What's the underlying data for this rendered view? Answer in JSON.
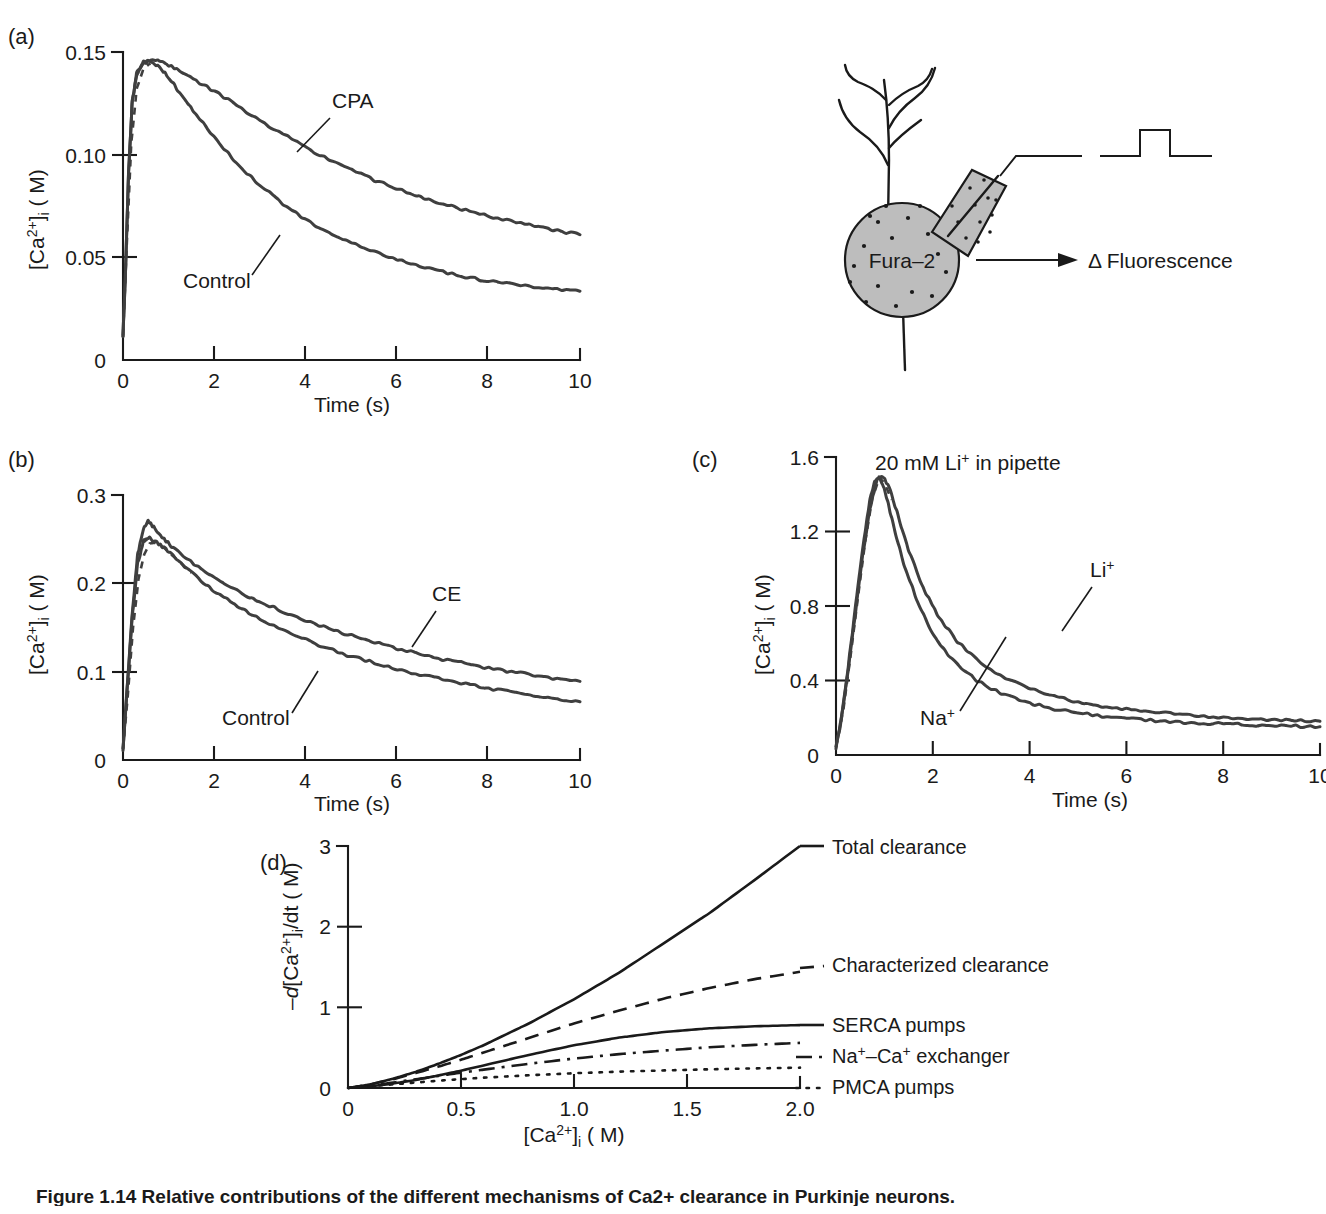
{
  "figure": {
    "caption": "Figure 1.14 Relative contributions of the different mechanisms of Ca2+ clearance in Purkinje neurons."
  },
  "panels": {
    "a": {
      "letter": "(a)",
      "xlabel": "Time (s)",
      "ylabel_prefix": "[Ca",
      "ylabel_sup": "2+",
      "ylabel_mid": "]",
      "ylabel_sub": "i",
      "ylabel_suffix": " ( M)",
      "xticks": [
        "0",
        "2",
        "4",
        "6",
        "8",
        "10"
      ],
      "yticks": [
        "0",
        "0.05",
        "0.10",
        "0.15"
      ],
      "labels": {
        "upper": "CPA",
        "lower": "Control"
      }
    },
    "b": {
      "letter": "(b)",
      "xlabel": "Time (s)",
      "ylabel_prefix": "[Ca",
      "ylabel_sup": "2+",
      "ylabel_mid": "]",
      "ylabel_sub": "i",
      "ylabel_suffix": " ( M)",
      "xticks": [
        "0",
        "2",
        "4",
        "6",
        "8",
        "10"
      ],
      "yticks": [
        "0",
        "0.1",
        "0.2",
        "0.3"
      ],
      "labels": {
        "upper": "CE",
        "lower": "Control"
      }
    },
    "c": {
      "letter": "(c)",
      "title_prefix": "20 mM Li",
      "title_sup": "+",
      "title_suffix": " in pipette",
      "xlabel": "Time (s)",
      "ylabel_prefix": "[Ca",
      "ylabel_sup": "2+",
      "ylabel_mid": "]",
      "ylabel_sub": "i",
      "ylabel_suffix": " ( M)",
      "xticks": [
        "0",
        "2",
        "4",
        "6",
        "8",
        "10"
      ],
      "yticks": [
        "0",
        "0.4",
        "0.8",
        "1.2",
        "1.6"
      ],
      "labels": {
        "upper_prefix": "Li",
        "upper_sup": "+",
        "lower_prefix": "Na",
        "lower_sup": "+"
      }
    },
    "d": {
      "letter": "(d)",
      "xlabel_prefix": "[Ca",
      "xlabel_sup": "2+",
      "xlabel_mid": "]",
      "xlabel_sub": "i",
      "xlabel_suffix": " ( M)",
      "ylabel_neg": "–",
      "ylabel_d": "d",
      "ylabel_prefix": "[Ca",
      "ylabel_sup": "2+",
      "ylabel_mid": "]",
      "ylabel_sub": "i",
      "ylabel_suffix": "/dt ( M)",
      "xticks": [
        "0",
        "0.5",
        "1.0",
        "1.5",
        "2.0"
      ],
      "yticks": [
        "0",
        "1",
        "2",
        "3"
      ],
      "legend": [
        {
          "name": "total-clearance",
          "label": "Total clearance",
          "style": "solid"
        },
        {
          "name": "characterized-clearance",
          "label": "Characterized clearance",
          "style": "dashed"
        },
        {
          "name": "serca-pumps",
          "label": "SERCA pumps",
          "style": "solid"
        },
        {
          "name": "na-ca-exchanger",
          "label_parts": [
            "Na",
            "+",
            "–Ca",
            "+",
            " exchanger"
          ],
          "label": "Na+–Ca+ exchanger",
          "style": "dashdot"
        },
        {
          "name": "pmca-pumps",
          "label": "PMCA pumps",
          "style": "dotted"
        }
      ]
    },
    "diagram": {
      "cell_label": "Fura–2",
      "output_label": "Δ Fluorescence"
    }
  },
  "chart_data": [
    {
      "id": "a",
      "type": "line",
      "title": "",
      "xlabel": "Time (s)",
      "ylabel": "[Ca2+]i ( M)",
      "xlim": [
        0,
        10
      ],
      "ylim": [
        0,
        0.15
      ],
      "grid": false,
      "legend_position": "inline-annotations",
      "series": [
        {
          "name": "CPA",
          "style": "solid-noisy",
          "x": [
            0,
            0.05,
            0.12,
            0.2,
            0.3,
            0.45,
            0.6,
            0.8,
            1.0,
            1.3,
            1.6,
            2.0,
            2.5,
            3.0,
            3.5,
            4.0,
            4.5,
            5.0,
            5.5,
            6.0,
            6.5,
            7.0,
            7.5,
            8.0,
            8.5,
            9.0,
            9.5,
            10.0
          ],
          "y": [
            0.012,
            0.04,
            0.09,
            0.125,
            0.139,
            0.1445,
            0.146,
            0.1455,
            0.1435,
            0.14,
            0.136,
            0.131,
            0.124,
            0.1165,
            0.11,
            0.1035,
            0.0975,
            0.0925,
            0.0875,
            0.0835,
            0.0795,
            0.076,
            0.073,
            0.07,
            0.0675,
            0.0655,
            0.063,
            0.061
          ]
        },
        {
          "name": "Control",
          "style": "solid-noisy",
          "x": [
            0,
            0.05,
            0.12,
            0.2,
            0.3,
            0.45,
            0.6,
            0.8,
            1.0,
            1.3,
            1.6,
            2.0,
            2.5,
            3.0,
            3.5,
            4.0,
            4.5,
            5.0,
            5.5,
            6.0,
            6.5,
            7.0,
            7.5,
            8.0,
            8.5,
            9.0,
            9.5,
            10.0
          ],
          "y": [
            0.012,
            0.04,
            0.09,
            0.125,
            0.14,
            0.1455,
            0.1455,
            0.1425,
            0.1375,
            0.1285,
            0.1195,
            0.1085,
            0.0955,
            0.085,
            0.076,
            0.0685,
            0.062,
            0.057,
            0.0525,
            0.049,
            0.0455,
            0.043,
            0.0405,
            0.0385,
            0.037,
            0.0355,
            0.0345,
            0.0335
          ]
        },
        {
          "name": "rising-dashed-overlay",
          "style": "dashed",
          "x": [
            0.0,
            0.08,
            0.18,
            0.3,
            0.45,
            0.6
          ],
          "y": [
            0.012,
            0.055,
            0.105,
            0.132,
            0.142,
            0.1445
          ]
        }
      ]
    },
    {
      "id": "b",
      "type": "line",
      "title": "",
      "xlabel": "Time (s)",
      "ylabel": "[Ca2+]i ( M)",
      "xlim": [
        0,
        10
      ],
      "ylim": [
        0,
        0.3
      ],
      "grid": false,
      "legend_position": "inline-annotations",
      "series": [
        {
          "name": "CE",
          "style": "solid-noisy",
          "x": [
            0,
            0.08,
            0.2,
            0.32,
            0.45,
            0.55,
            0.7,
            0.9,
            1.1,
            1.4,
            1.8,
            2.2,
            2.6,
            3.0,
            3.5,
            4.0,
            4.5,
            5.0,
            5.5,
            6.0,
            6.5,
            7.0,
            7.5,
            8.0,
            8.5,
            9.0,
            9.5,
            10.0
          ],
          "y": [
            0.012,
            0.075,
            0.165,
            0.232,
            0.262,
            0.27,
            0.262,
            0.25,
            0.24,
            0.228,
            0.213,
            0.2,
            0.189,
            0.179,
            0.168,
            0.158,
            0.149,
            0.141,
            0.133,
            0.126,
            0.12,
            0.114,
            0.109,
            0.104,
            0.1,
            0.096,
            0.092,
            0.089
          ]
        },
        {
          "name": "Control",
          "style": "solid-noisy",
          "x": [
            0,
            0.08,
            0.2,
            0.32,
            0.45,
            0.55,
            0.7,
            0.9,
            1.1,
            1.4,
            1.8,
            2.2,
            2.6,
            3.0,
            3.5,
            4.0,
            4.5,
            5.0,
            5.5,
            6.0,
            6.5,
            7.0,
            7.5,
            8.0,
            8.5,
            9.0,
            9.5,
            10.0
          ],
          "y": [
            0.012,
            0.072,
            0.16,
            0.222,
            0.248,
            0.252,
            0.248,
            0.24,
            0.231,
            0.217,
            0.199,
            0.184,
            0.171,
            0.16,
            0.147,
            0.136,
            0.126,
            0.117,
            0.11,
            0.103,
            0.097,
            0.091,
            0.086,
            0.081,
            0.077,
            0.073,
            0.069,
            0.066
          ]
        },
        {
          "name": "rising-dashed-overlay",
          "style": "dashed",
          "x": [
            0.0,
            0.1,
            0.22,
            0.34,
            0.46,
            0.58,
            0.7,
            0.9,
            1.2,
            1.5
          ],
          "y": [
            0.012,
            0.07,
            0.15,
            0.205,
            0.232,
            0.245,
            0.246,
            0.24,
            0.226,
            0.212
          ]
        }
      ]
    },
    {
      "id": "c",
      "type": "line",
      "title": "20 mM Li+ in pipette",
      "xlabel": "Time (s)",
      "ylabel": "[Ca2+]i ( M)",
      "xlim": [
        0,
        10
      ],
      "ylim": [
        0,
        1.6
      ],
      "grid": false,
      "legend_position": "inline-annotations",
      "series": [
        {
          "name": "Li+",
          "style": "solid-noisy",
          "x": [
            0,
            0.1,
            0.25,
            0.4,
            0.55,
            0.7,
            0.85,
            0.95,
            1.1,
            1.3,
            1.5,
            1.8,
            2.1,
            2.5,
            3.0,
            3.5,
            4.0,
            4.5,
            5.0,
            5.5,
            6.0,
            6.5,
            7.0,
            7.5,
            8.0,
            8.5,
            9.0,
            9.5,
            10.0
          ],
          "y": [
            0.04,
            0.17,
            0.45,
            0.76,
            1.07,
            1.32,
            1.48,
            1.5,
            1.44,
            1.27,
            1.1,
            0.9,
            0.75,
            0.61,
            0.49,
            0.41,
            0.355,
            0.315,
            0.285,
            0.263,
            0.245,
            0.231,
            0.22,
            0.211,
            0.203,
            0.196,
            0.19,
            0.185,
            0.181
          ]
        },
        {
          "name": "Na+",
          "style": "solid-noisy",
          "x": [
            0,
            0.1,
            0.25,
            0.4,
            0.55,
            0.7,
            0.8,
            0.9,
            1.0,
            1.2,
            1.4,
            1.7,
            2.0,
            2.4,
            2.9,
            3.4,
            3.9,
            4.4,
            5.0,
            5.5,
            6.0,
            6.5,
            7.0,
            7.5,
            8.0,
            8.5,
            9.0,
            9.5,
            10.0
          ],
          "y": [
            0.04,
            0.18,
            0.47,
            0.79,
            1.11,
            1.37,
            1.47,
            1.49,
            1.43,
            1.22,
            1.03,
            0.81,
            0.65,
            0.51,
            0.4,
            0.33,
            0.285,
            0.253,
            0.226,
            0.209,
            0.196,
            0.186,
            0.178,
            0.172,
            0.167,
            0.162,
            0.158,
            0.155,
            0.152
          ]
        },
        {
          "name": "rising-dashed-overlay",
          "style": "dashed",
          "x": [
            0.0,
            0.15,
            0.3,
            0.45,
            0.6,
            0.75,
            0.9,
            1.0,
            1.15
          ],
          "y": [
            0.04,
            0.24,
            0.53,
            0.84,
            1.14,
            1.38,
            1.49,
            1.46,
            1.37
          ]
        }
      ]
    },
    {
      "id": "d",
      "type": "line",
      "title": "",
      "xlabel": "[Ca2+]i ( M)",
      "ylabel": "-d[Ca2+]i/dt ( M)",
      "xlim": [
        0,
        2.0
      ],
      "ylim": [
        0,
        3.0
      ],
      "grid": false,
      "legend_position": "right-inline",
      "series": [
        {
          "name": "Total clearance",
          "style": "solid",
          "x": [
            0,
            0.1,
            0.2,
            0.3,
            0.4,
            0.5,
            0.6,
            0.8,
            1.0,
            1.2,
            1.4,
            1.6,
            1.8,
            2.0
          ],
          "y": [
            0,
            0.045,
            0.115,
            0.2,
            0.3,
            0.41,
            0.53,
            0.8,
            1.1,
            1.43,
            1.8,
            2.17,
            2.58,
            3.0
          ]
        },
        {
          "name": "Characterized clearance",
          "style": "dashed",
          "x": [
            0,
            0.1,
            0.2,
            0.3,
            0.4,
            0.5,
            0.6,
            0.8,
            1.0,
            1.2,
            1.4,
            1.6,
            1.8,
            2.0
          ],
          "y": [
            0,
            0.045,
            0.11,
            0.185,
            0.265,
            0.35,
            0.44,
            0.62,
            0.8,
            0.96,
            1.11,
            1.24,
            1.35,
            1.44
          ]
        },
        {
          "name": "SERCA pumps",
          "style": "solid",
          "x": [
            0,
            0.1,
            0.2,
            0.3,
            0.4,
            0.5,
            0.6,
            0.8,
            1.0,
            1.2,
            1.4,
            1.6,
            1.8,
            2.0
          ],
          "y": [
            0,
            0.022,
            0.055,
            0.1,
            0.155,
            0.215,
            0.28,
            0.41,
            0.53,
            0.625,
            0.695,
            0.74,
            0.765,
            0.78
          ]
        },
        {
          "name": "Na+-Ca+ exchanger",
          "style": "dashdot",
          "x": [
            0,
            0.1,
            0.2,
            0.3,
            0.4,
            0.5,
            0.6,
            0.8,
            1.0,
            1.2,
            1.4,
            1.6,
            1.8,
            2.0
          ],
          "y": [
            0,
            0.03,
            0.068,
            0.108,
            0.15,
            0.19,
            0.228,
            0.3,
            0.365,
            0.42,
            0.465,
            0.505,
            0.535,
            0.56
          ]
        },
        {
          "name": "PMCA pumps",
          "style": "dotted",
          "x": [
            0,
            0.1,
            0.2,
            0.3,
            0.4,
            0.5,
            0.6,
            0.8,
            1.0,
            1.2,
            1.4,
            1.6,
            1.8,
            2.0
          ],
          "y": [
            0,
            0.022,
            0.045,
            0.068,
            0.09,
            0.11,
            0.128,
            0.158,
            0.183,
            0.203,
            0.218,
            0.232,
            0.243,
            0.252
          ]
        }
      ]
    }
  ]
}
